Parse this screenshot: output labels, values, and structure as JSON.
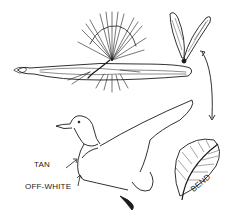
{
  "diagram": {
    "components": [
      {
        "name": "dry-fly",
        "description": "tied fly with hackle and body"
      },
      {
        "name": "wing-pair",
        "description": "pair of upright wings"
      },
      {
        "name": "duck",
        "description": "mallard duck with raised wing"
      },
      {
        "name": "feather",
        "description": "curved flank feather"
      },
      {
        "name": "double-arrow",
        "description": "arrow linking wings and feather"
      }
    ],
    "labels": {
      "tan": "TAN",
      "off_white": "OFF-WHITE",
      "bend": "BEND"
    },
    "colors": {
      "line": "#1a1a1a",
      "background": "#ffffff"
    }
  }
}
